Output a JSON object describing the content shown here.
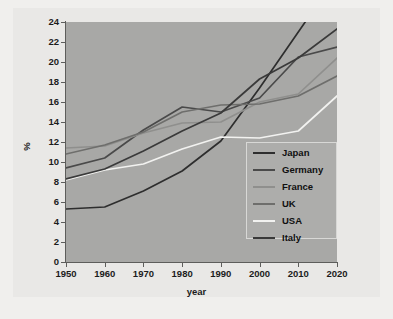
{
  "chart_data": {
    "type": "line",
    "title": "",
    "xlabel": "year",
    "ylabel": "%",
    "x": [
      1950,
      1960,
      1970,
      1980,
      1990,
      2000,
      2010,
      2020
    ],
    "xlim": [
      1950,
      2020
    ],
    "ylim": [
      0,
      24
    ],
    "xticks": [
      "1950",
      "1960",
      "1970",
      "1980",
      "1990",
      "2000",
      "2010",
      "2020"
    ],
    "yticks": [
      "0",
      "2",
      "4",
      "6",
      "8",
      "10",
      "12",
      "14",
      "16",
      "18",
      "20",
      "22",
      "24"
    ],
    "grid": false,
    "legend_position": "center-right",
    "series": [
      {
        "name": "Japan",
        "color": "#2e2e2e",
        "values": [
          5.3,
          5.5,
          7.1,
          9.1,
          12.1,
          17.4,
          23.0,
          28.6
        ]
      },
      {
        "name": "Germany",
        "color": "#4a4a4a",
        "values": [
          9.4,
          10.4,
          13.2,
          15.5,
          15.0,
          16.4,
          20.5,
          21.5
        ]
      },
      {
        "name": "France",
        "color": "#8f8f8d",
        "values": [
          11.4,
          11.6,
          12.9,
          13.9,
          14.0,
          16.0,
          16.8,
          20.4
        ]
      },
      {
        "name": "UK",
        "color": "#6e6e6c",
        "values": [
          10.8,
          11.7,
          13.0,
          15.0,
          15.7,
          15.8,
          16.6,
          18.6
        ]
      },
      {
        "name": "USA",
        "color": "#f2f2f0",
        "values": [
          8.2,
          9.2,
          9.8,
          11.3,
          12.5,
          12.4,
          13.1,
          16.6
        ]
      },
      {
        "name": "Italy",
        "color": "#3a3a3a",
        "values": [
          8.3,
          9.3,
          11.1,
          13.1,
          14.9,
          18.3,
          20.4,
          23.3
        ]
      }
    ]
  },
  "axes": {
    "y_title": "%",
    "x_title": "year"
  },
  "legend": {
    "entries": [
      {
        "label": "Japan"
      },
      {
        "label": "Germany"
      },
      {
        "label": "France"
      },
      {
        "label": "UK"
      },
      {
        "label": "USA"
      },
      {
        "label": "Italy"
      }
    ]
  }
}
